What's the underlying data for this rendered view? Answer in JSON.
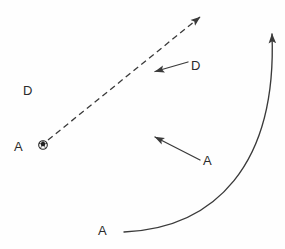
{
  "diagram": {
    "width": 285,
    "height": 249,
    "background_color": "#fefefe",
    "stroke_color": "#3a3a3a",
    "text_color": "#2b2b2b",
    "labels": [
      {
        "id": "attacker-with-ball",
        "text": "A",
        "role": "attacker",
        "x": 14,
        "y": 140
      },
      {
        "id": "defender-left",
        "text": "D",
        "role": "defender",
        "x": 23,
        "y": 84
      },
      {
        "id": "defender-upper-right",
        "text": "D",
        "role": "defender",
        "x": 191,
        "y": 59
      },
      {
        "id": "attacker-middle",
        "text": "A",
        "role": "attacker",
        "x": 203,
        "y": 154
      },
      {
        "id": "attacker-bottom",
        "text": "A",
        "role": "attacker",
        "x": 98,
        "y": 224
      }
    ],
    "ball": {
      "id": "soccer-ball",
      "label": "soccer-ball-icon",
      "cx": 43,
      "cy": 145,
      "r": 4.2,
      "fill": "#ffffff",
      "stroke": "#222222"
    },
    "arrows": [
      {
        "id": "pass-path",
        "kind": "pass",
        "style": "dashed",
        "dash_pattern": "6 4",
        "from": {
          "x": 48,
          "y": 140
        },
        "to": {
          "x": 202,
          "y": 16
        },
        "stroke_width": 1.3
      },
      {
        "id": "defender-run",
        "kind": "defender-movement",
        "style": "solid",
        "from": {
          "x": 188,
          "y": 62
        },
        "to": {
          "x": 153,
          "y": 72
        },
        "stroke_width": 1.3
      },
      {
        "id": "attacker-run-middle",
        "kind": "attacker-movement",
        "style": "solid",
        "from": {
          "x": 200,
          "y": 160
        },
        "to": {
          "x": 153,
          "y": 136
        },
        "stroke_width": 1.3
      },
      {
        "id": "attacker-overlap-run",
        "kind": "attacker-curved-run",
        "style": "solid-curved",
        "from": {
          "x": 124,
          "y": 232
        },
        "control1": {
          "x": 215,
          "y": 228
        },
        "control2": {
          "x": 277,
          "y": 165
        },
        "to": {
          "x": 272,
          "y": 30
        },
        "stroke_width": 1.4
      }
    ]
  }
}
